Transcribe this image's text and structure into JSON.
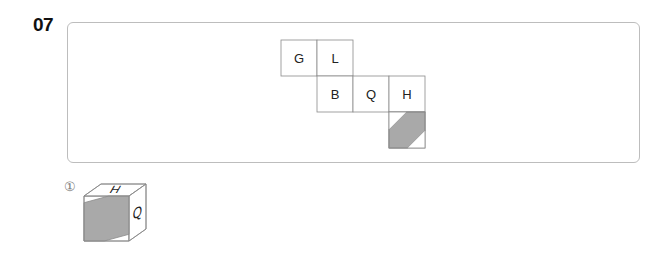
{
  "question": {
    "number": "07"
  },
  "net": {
    "cells": [
      {
        "label": "G",
        "row": 0,
        "col": 0
      },
      {
        "label": "L",
        "row": 0,
        "col": 1
      },
      {
        "label": "B",
        "row": 1,
        "col": 1
      },
      {
        "label": "Q",
        "row": 1,
        "col": 2
      },
      {
        "label": "H",
        "row": 1,
        "col": 3
      },
      {
        "label": "",
        "row": 2,
        "col": 3,
        "shaded": true
      }
    ]
  },
  "options": [
    {
      "marker": "①",
      "top": "H",
      "front": "",
      "right": "Q",
      "shaded_face": "front"
    },
    {
      "marker": "②",
      "top": "",
      "front": "G",
      "right": "B",
      "shaded_face": "top"
    },
    {
      "marker": "③",
      "top": "Q",
      "front": "B",
      "right": "",
      "shaded_face": "right"
    },
    {
      "marker": "④",
      "top": "G",
      "front": "",
      "right": "Q",
      "shaded_face": "front"
    }
  ],
  "colors": {
    "shade": "#a9a9a9",
    "line": "#8a8a8a"
  }
}
